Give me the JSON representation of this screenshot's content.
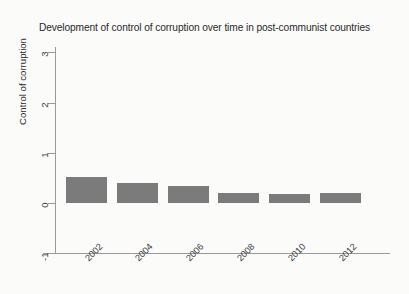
{
  "chart_data": {
    "type": "bar",
    "title": "Development of control of corruption over time in post-communist countries",
    "xlabel": "",
    "ylabel": "Control of corruption",
    "categories": [
      "2002",
      "2004",
      "2006",
      "2008",
      "2010",
      "2012"
    ],
    "values": [
      0.52,
      0.4,
      0.34,
      0.2,
      0.18,
      0.2
    ],
    "ylim": [
      -1,
      3
    ],
    "yticks": [
      3,
      2,
      1,
      0,
      -1
    ],
    "ytick_labels": [
      "3",
      "2",
      "1",
      "0",
      "-1"
    ],
    "grid": false,
    "legend": null,
    "bar_color": "#7b7b7b",
    "axis_color": "#9a9a9a",
    "background_color": "#fbfbfa"
  }
}
